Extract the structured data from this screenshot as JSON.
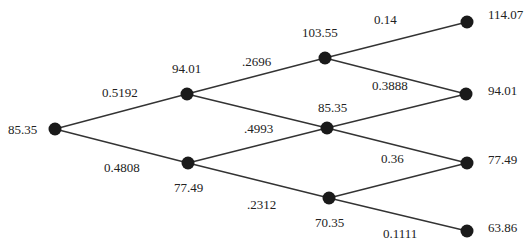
{
  "colors": {
    "node": "#1a1a1a",
    "edge": "#333333",
    "text": "#222222",
    "background": "#ffffff"
  },
  "nodes": [
    {
      "id": "n0",
      "value": "85.35",
      "x": 55,
      "y": 129,
      "label_x": 8,
      "label_y": 134,
      "anchor": "start"
    },
    {
      "id": "n1u",
      "value": "94.01",
      "x": 187,
      "y": 94,
      "label_x": 172,
      "label_y": 73,
      "anchor": "start"
    },
    {
      "id": "n1d",
      "value": "77.49",
      "x": 188,
      "y": 163,
      "label_x": 174,
      "label_y": 192,
      "anchor": "start"
    },
    {
      "id": "n2u",
      "value": "103.55",
      "x": 325,
      "y": 58,
      "label_x": 302,
      "label_y": 37,
      "anchor": "start"
    },
    {
      "id": "n2m",
      "value": "85.35",
      "x": 327,
      "y": 128,
      "label_x": 318,
      "label_y": 112,
      "anchor": "start"
    },
    {
      "id": "n2d",
      "value": "70.35",
      "x": 329,
      "y": 198,
      "label_x": 315,
      "label_y": 227,
      "anchor": "start"
    },
    {
      "id": "n3a",
      "value": "114.07",
      "x": 467,
      "y": 22,
      "label_x": 488,
      "label_y": 19,
      "anchor": "start"
    },
    {
      "id": "n3b",
      "value": "94.01",
      "x": 466,
      "y": 94,
      "label_x": 488,
      "label_y": 95,
      "anchor": "start"
    },
    {
      "id": "n3c",
      "value": "77.49",
      "x": 467,
      "y": 163,
      "label_x": 488,
      "label_y": 164,
      "anchor": "start"
    },
    {
      "id": "n3d",
      "value": "63.86",
      "x": 467,
      "y": 231,
      "label_x": 488,
      "label_y": 232,
      "anchor": "start"
    }
  ],
  "edges": [
    {
      "from": "n0",
      "to": "n1u",
      "prob": "0.5192",
      "label_x": 102,
      "label_y": 97
    },
    {
      "from": "n0",
      "to": "n1d",
      "prob": "0.4808",
      "label_x": 104,
      "label_y": 172
    },
    {
      "from": "n1u",
      "to": "n2u",
      "prob": ".2696",
      "label_x": 242,
      "label_y": 66
    },
    {
      "from": "n1u",
      "to": "n2m",
      "prob": ".4993",
      "label_x": 244,
      "label_y": 133
    },
    {
      "from": "n1d",
      "to": "n2m",
      "prob": "",
      "label_x": 0,
      "label_y": 0
    },
    {
      "from": "n1d",
      "to": "n2d",
      "prob": ".2312",
      "label_x": 247,
      "label_y": 209
    },
    {
      "from": "n2u",
      "to": "n3a",
      "prob": "0.14",
      "label_x": 374,
      "label_y": 24
    },
    {
      "from": "n2u",
      "to": "n3b",
      "prob": "0.3888",
      "label_x": 372,
      "label_y": 90
    },
    {
      "from": "n2m",
      "to": "n3b",
      "prob": "",
      "label_x": 0,
      "label_y": 0
    },
    {
      "from": "n2m",
      "to": "n3c",
      "prob": "0.36",
      "label_x": 381,
      "label_y": 163
    },
    {
      "from": "n2d",
      "to": "n3c",
      "prob": "",
      "label_x": 0,
      "label_y": 0
    },
    {
      "from": "n2d",
      "to": "n3d",
      "prob": "0.1111",
      "label_x": 383,
      "label_y": 238
    }
  ]
}
